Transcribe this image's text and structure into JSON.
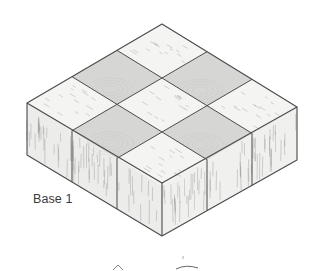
{
  "figure": {
    "label": "Base 1",
    "label_position": {
      "x": 33,
      "y": 192
    },
    "grid": {
      "rows": 3,
      "cols": 3
    },
    "vertices": {
      "top": [
        162,
        24
      ],
      "left_top": [
        27,
        103
      ],
      "front_top": [
        162,
        183
      ],
      "right_top": [
        297,
        107
      ],
      "left_bottom": [
        27,
        155
      ],
      "front_bottom": [
        162,
        236
      ],
      "right_bottom": [
        297,
        160
      ]
    },
    "colors": {
      "outline": "#4a4a4a",
      "light_tile": "#f4f4f2",
      "dark_tile": "#d6d6d4",
      "side_left": "#ececea",
      "side_right": "#f0f0ee",
      "grain": "#8a8a8a"
    },
    "dark_tiles": [
      [
        0,
        1
      ],
      [
        1,
        0
      ],
      [
        1,
        2
      ],
      [
        2,
        1
      ]
    ]
  }
}
